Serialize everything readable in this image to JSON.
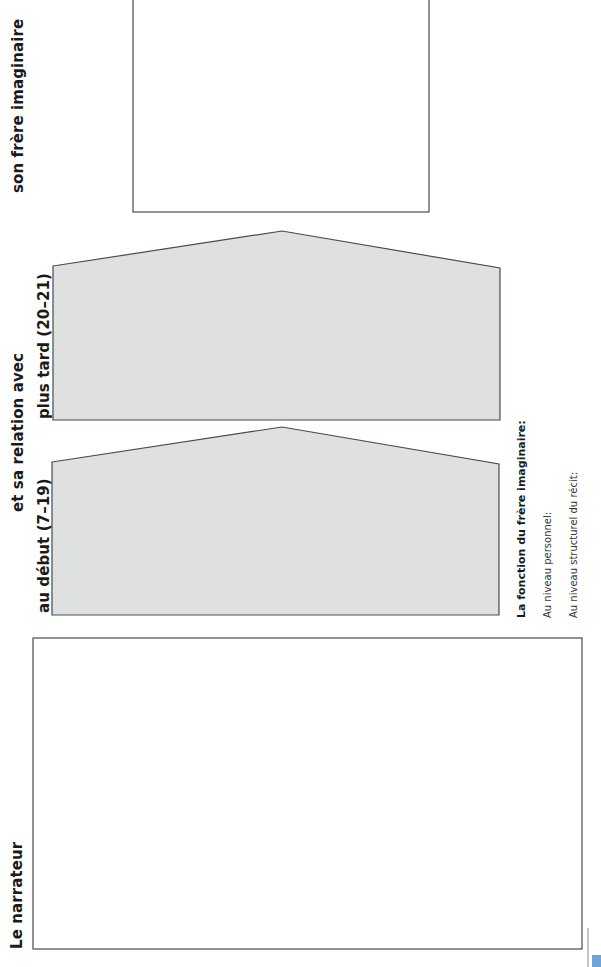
{
  "labels": {
    "narrator": "Le narrateur",
    "relation": "et sa relation avec",
    "beginning": "au début (7–19)",
    "later": "plus tard (20–21)",
    "imaginary_brother": "son frère imaginaire"
  },
  "function_section": {
    "title": "La fonction du frère imaginaire:",
    "personal_level": "Au niveau personnel:",
    "structural_level": "Au niveau structurel du récit:"
  },
  "colors": {
    "shape_fill": "#dfe0e0",
    "line": "#4a4a4a",
    "corner_mark": "#6fa3d8"
  }
}
